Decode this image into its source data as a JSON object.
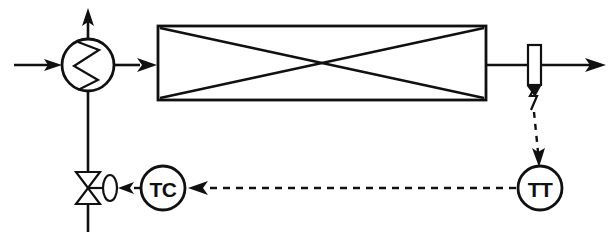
{
  "diagram": {
    "type": "process-flow-diagram",
    "background_color": "#ffffff",
    "line_color": "#101010"
  },
  "instruments": {
    "controller": {
      "tag": "TC",
      "name": "temperature-controller",
      "cx": 163,
      "cy": 188,
      "r": 22
    },
    "transmitter": {
      "tag": "TT",
      "name": "temperature-transmitter",
      "cx": 540,
      "cy": 188,
      "r": 22
    }
  },
  "equipment": {
    "heat_exchanger": {
      "name": "heat-exchanger",
      "symbol": "circle-with-zigzag",
      "cx": 88,
      "cy": 65,
      "r": 26
    },
    "vessel": {
      "name": "shell-and-tube-vessel",
      "symbol": "rectangle-with-crossed-diagonals",
      "x": 158,
      "y": 26,
      "width": 328,
      "height": 74
    },
    "control_valve": {
      "name": "control-valve",
      "symbol": "bowtie-with-diaphragm-actuator",
      "cx": 88,
      "cy": 188
    },
    "thermowell": {
      "name": "thermowell-sensor",
      "symbol": "vertical-rectangle-with-probe",
      "x": 528,
      "y": 45,
      "width": 13,
      "height": 40
    }
  },
  "streams": {
    "feed_inlet": {
      "label": "",
      "name": "feed-inlet-line"
    },
    "vent_outlet": {
      "label": "",
      "name": "vent-outlet-line"
    },
    "exchanger_to_vessel": {
      "label": "",
      "name": "exchanger-to-vessel-line"
    },
    "product_outlet": {
      "label": "",
      "name": "product-outlet-line"
    },
    "utility_supply": {
      "label": "",
      "name": "utility-supply-line"
    }
  },
  "signals": {
    "sensor_to_transmitter": {
      "name": "sensor-to-transmitter-signal",
      "style": "dashed"
    },
    "transmitter_to_controller": {
      "name": "transmitter-to-controller-signal",
      "style": "dashed"
    },
    "controller_to_valve": {
      "name": "controller-to-valve-signal",
      "style": "dashed"
    }
  }
}
